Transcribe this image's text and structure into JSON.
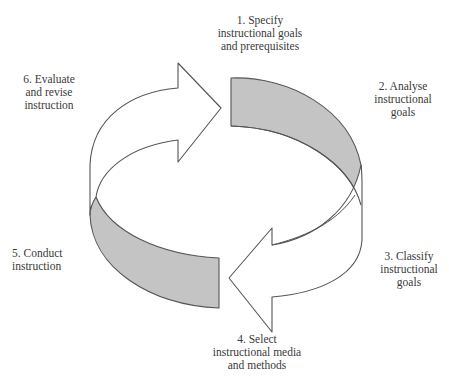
{
  "diagram": {
    "type": "cycle",
    "colors": {
      "outline": "#555555",
      "band_fill": "#c4c4c4",
      "arrow_fill": "#ffffff",
      "text": "#3a3a3a"
    },
    "steps": [
      {
        "number": "1.",
        "lines": [
          "1. Specify",
          "instructional goals",
          "and prerequisites"
        ]
      },
      {
        "number": "2.",
        "lines": [
          "2. Analyse",
          "instructional",
          "goals"
        ]
      },
      {
        "number": "3.",
        "lines": [
          "3. Classify",
          "instructional",
          "goals"
        ]
      },
      {
        "number": "4.",
        "lines": [
          "4. Select",
          "instructional media",
          "and methods"
        ]
      },
      {
        "number": "5.",
        "lines": [
          "5. Conduct",
          "instruction"
        ]
      },
      {
        "number": "6.",
        "lines": [
          "6. Evaluate",
          "and revise",
          "instruction"
        ]
      }
    ],
    "shapes": [
      {
        "name": "upper-left-arrow",
        "fill": "white",
        "direction": "right"
      },
      {
        "name": "upper-right-band",
        "fill": "gray"
      },
      {
        "name": "lower-right-arrow",
        "fill": "white",
        "direction": "left"
      },
      {
        "name": "lower-left-band",
        "fill": "gray"
      }
    ]
  }
}
